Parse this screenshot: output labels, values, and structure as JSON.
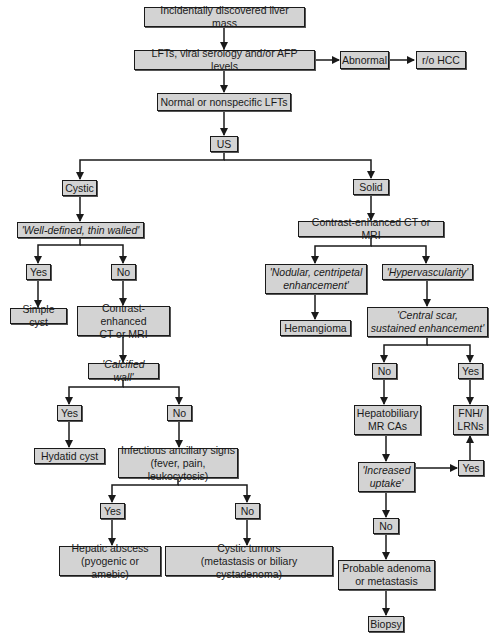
{
  "diagram": {
    "type": "flowchart",
    "colors": {
      "node_fill": "#d3d3d3",
      "node_border": "#1a1a1a",
      "edge": "#1a1a1a",
      "background": "#ffffff"
    },
    "nodes": {
      "start": "Incidentally discovered liver mass",
      "labs": "LFTs, viral serology and/or AFP levels",
      "abnormal": "Abnormal",
      "rohcc": "r/o HCC",
      "normal": "Normal or nonspecific LFTs",
      "us": "US",
      "cystic": "Cystic",
      "welldefined": "'Well-defined, thin walled'",
      "wd_yes": "Yes",
      "wd_no": "No",
      "simplecyst": "Simple cyst",
      "ct_left": "Contrast-enhanced\nCT or MRI",
      "calcified": "'Calcified wall'",
      "cw_yes": "Yes",
      "cw_no": "No",
      "hydatid": "Hydatid cyst",
      "infectious": "Infectious ancillary signs\n(fever, pain, leukocytosis)",
      "inf_yes": "Yes",
      "inf_no": "No",
      "abscess": "Hepatic abscess\n(pyogenic or amebic)",
      "cystictumors": "Cystic tumors\n(metastasis or biliary cystadenoma)",
      "solid": "Solid",
      "ct_right": "Contrast-enhanced CT or MRI",
      "nodular": "'Nodular, centripetal\nenhancement'",
      "hypervasc": "'Hypervascularity'",
      "hemangioma": "Hemangioma",
      "centralscar": "'Central scar,\nsustained enhancement'",
      "cs_no": "No",
      "cs_yes": "Yes",
      "hepatobiliary": "Hepatobiliary\nMR CAs",
      "fnh": "FNH/\nLRNs",
      "uptake": "'Increased\nuptake'",
      "up_yes": "Yes",
      "up_no": "No",
      "adenoma": "Probable adenoma\nor metastasis",
      "biopsy": "Biopsy"
    },
    "edges": [
      [
        "start",
        "labs"
      ],
      [
        "labs",
        "abnormal"
      ],
      [
        "abnormal",
        "rohcc"
      ],
      [
        "labs",
        "normal"
      ],
      [
        "normal",
        "us"
      ],
      [
        "us",
        "cystic"
      ],
      [
        "us",
        "solid"
      ],
      [
        "cystic",
        "welldefined"
      ],
      [
        "welldefined",
        "wd_yes"
      ],
      [
        "welldefined",
        "wd_no"
      ],
      [
        "wd_yes",
        "simplecyst"
      ],
      [
        "wd_no",
        "ct_left"
      ],
      [
        "ct_left",
        "calcified"
      ],
      [
        "calcified",
        "cw_yes"
      ],
      [
        "calcified",
        "cw_no"
      ],
      [
        "cw_yes",
        "hydatid"
      ],
      [
        "cw_no",
        "infectious"
      ],
      [
        "infectious",
        "inf_yes"
      ],
      [
        "infectious",
        "inf_no"
      ],
      [
        "inf_yes",
        "abscess"
      ],
      [
        "inf_no",
        "cystictumors"
      ],
      [
        "solid",
        "ct_right"
      ],
      [
        "ct_right",
        "nodular"
      ],
      [
        "ct_right",
        "hypervasc"
      ],
      [
        "nodular",
        "hemangioma"
      ],
      [
        "hypervasc",
        "centralscar"
      ],
      [
        "centralscar",
        "cs_no"
      ],
      [
        "centralscar",
        "cs_yes"
      ],
      [
        "cs_no",
        "hepatobiliary"
      ],
      [
        "cs_yes",
        "fnh"
      ],
      [
        "hepatobiliary",
        "uptake"
      ],
      [
        "uptake",
        "up_yes"
      ],
      [
        "up_yes",
        "fnh"
      ],
      [
        "uptake",
        "up_no"
      ],
      [
        "up_no",
        "adenoma"
      ],
      [
        "adenoma",
        "biopsy"
      ]
    ]
  }
}
